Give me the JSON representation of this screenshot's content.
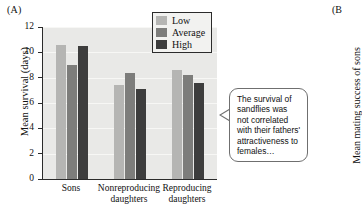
{
  "panel_a": {
    "label": "(A)",
    "y_axis_title": "Mean survival (days)",
    "y_ticks": [
      "12",
      "10",
      "8",
      "6",
      "4",
      "2",
      "0"
    ],
    "legend": {
      "items": [
        {
          "label": "Low",
          "color": "#b5b5b3",
          "swatch": "legend-swatch-low"
        },
        {
          "label": "Average",
          "color": "#7d7d7b",
          "swatch": "legend-swatch-average"
        },
        {
          "label": "High",
          "color": "#3d3d3d",
          "swatch": "legend-swatch-high"
        }
      ]
    },
    "callout": {
      "text": "The survival of sandflies was not correlated with their fathers' attractiveness to females…",
      "border_color": "#6f6f6f"
    }
  },
  "panel_b": {
    "label": "(B",
    "y_axis_title": "Mean mating success of sons"
  },
  "chart_data": {
    "type": "bar",
    "title": "",
    "xlabel": "",
    "ylabel": "Mean survival (days)",
    "ylim": [
      0,
      12
    ],
    "yticks": [
      0,
      2,
      4,
      6,
      8,
      10,
      12
    ],
    "grid": true,
    "legend_position": "top-right",
    "categories": [
      "Sons",
      "Nonreproducing daughters",
      "Reproducing daughters"
    ],
    "series": [
      {
        "name": "Low",
        "color": "#b5b5b3",
        "values": [
          10.6,
          7.4,
          8.6
        ]
      },
      {
        "name": "Average",
        "color": "#7d7d7b",
        "values": [
          9.0,
          8.4,
          8.2
        ]
      },
      {
        "name": "High",
        "color": "#3d3d3d",
        "values": [
          10.5,
          7.1,
          7.6
        ]
      }
    ]
  }
}
